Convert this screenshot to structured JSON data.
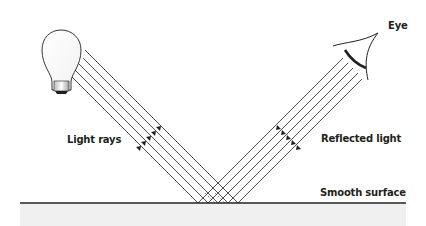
{
  "diagram": {
    "type": "specular-reflection",
    "labels": {
      "light_rays": "Light rays",
      "reflected_light": "Reflected light",
      "smooth_surface": "Smooth surface",
      "eye": "Eye"
    },
    "elements": {
      "light_source": "light-bulb-icon",
      "observer": "eye-icon",
      "incident_ray_count": 5,
      "reflected_ray_count": 5
    },
    "colors": {
      "line": "#231f20",
      "surface_fill": "#f0f0f0",
      "background": "#ffffff"
    }
  }
}
